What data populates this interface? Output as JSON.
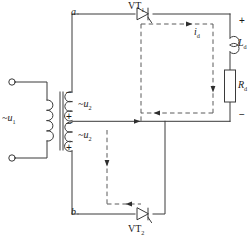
{
  "diagram": {
    "type": "circuit-schematic",
    "stroke_color": "#3a3a3a",
    "dashed_color": "#555555",
    "text_color": "#1a1a1a",
    "background": "#ffffff"
  },
  "labels": {
    "node_a": "a",
    "node_b": "b",
    "source_u1": "~u",
    "source_u1_sub": "1",
    "winding_u2_top": "~u",
    "winding_u2_top_sub": "2",
    "winding_u2_bottom": "~u",
    "winding_u2_bottom_sub": "2",
    "thyristor_1": "VT",
    "thyristor_1_sub": "1",
    "thyristor_2": "VT",
    "thyristor_2_sub": "2",
    "inductor": "L",
    "inductor_sub": "d",
    "resistor": "R",
    "resistor_sub": "d",
    "current": "i",
    "current_sub": "d"
  },
  "polarity": {
    "winding_top_minus": "−",
    "winding_top_plus": "+",
    "winding_bottom_minus": "−",
    "winding_bottom_plus": "+",
    "output_plus": "+",
    "output_minus": "−"
  },
  "components": [
    {
      "name": "primary-winding",
      "label": "~u1",
      "kind": "coil"
    },
    {
      "name": "secondary-winding-upper",
      "label": "~u2",
      "kind": "coil"
    },
    {
      "name": "secondary-winding-lower",
      "label": "~u2",
      "kind": "coil"
    },
    {
      "name": "thyristor-vt1",
      "label": "VT1",
      "kind": "thyristor"
    },
    {
      "name": "thyristor-vt2",
      "label": "VT2",
      "kind": "thyristor"
    },
    {
      "name": "inductor-ld",
      "label": "Ld",
      "kind": "inductor"
    },
    {
      "name": "resistor-rd",
      "label": "Rd",
      "kind": "resistor"
    },
    {
      "name": "input-terminal-top",
      "label": "",
      "kind": "terminal"
    },
    {
      "name": "input-terminal-bottom",
      "label": "",
      "kind": "terminal"
    }
  ]
}
